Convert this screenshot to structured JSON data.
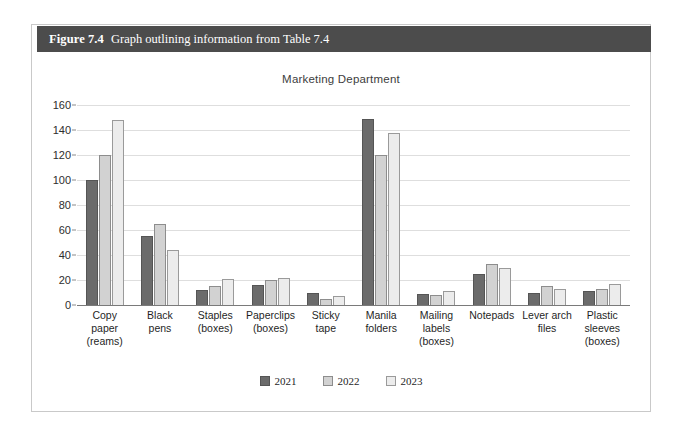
{
  "figure": {
    "number_label": "Figure 7.4",
    "caption": "Graph outlining information from Table 7.4"
  },
  "colors": {
    "header_bar": "#4c4c4c",
    "series_2021": "#6b6b6b",
    "series_2022": "#d2d2d2",
    "series_2023": "#ececec",
    "gridline": "#dedede",
    "axis": "#7a7a7a"
  },
  "chart_data": {
    "type": "bar",
    "title": "Marketing Department",
    "xlabel": "",
    "ylabel": "",
    "ylim": [
      0,
      160
    ],
    "ytick_step": 20,
    "yticks": [
      0,
      20,
      40,
      60,
      80,
      100,
      120,
      140,
      160
    ],
    "grid": true,
    "legend_position": "bottom",
    "categories": [
      "Copy paper (reams)",
      "Black pens",
      "Staples (boxes)",
      "Paperclips (boxes)",
      "Sticky tape",
      "Manila folders",
      "Mailing labels (boxes)",
      "Notepads",
      "Lever arch files",
      "Plastic sleeves (boxes)"
    ],
    "category_lines": [
      [
        "Copy",
        "paper",
        "(reams)"
      ],
      [
        "Black",
        "pens"
      ],
      [
        "Staples",
        "(boxes)"
      ],
      [
        "Paperclips",
        "(boxes)"
      ],
      [
        "Sticky",
        "tape"
      ],
      [
        "Manila",
        "folders"
      ],
      [
        "Mailing",
        "labels",
        "(boxes)"
      ],
      [
        "Notepads"
      ],
      [
        "Lever arch",
        "files"
      ],
      [
        "Plastic",
        "sleeves",
        "(boxes)"
      ]
    ],
    "series": [
      {
        "name": "2021",
        "values": [
          100,
          55,
          12,
          16,
          10,
          149,
          9,
          25,
          10,
          11
        ]
      },
      {
        "name": "2022",
        "values": [
          120,
          65,
          15,
          20,
          5,
          120,
          8,
          33,
          15,
          13
        ]
      },
      {
        "name": "2023",
        "values": [
          148,
          44,
          21,
          22,
          7,
          138,
          11,
          30,
          13,
          17
        ]
      }
    ]
  }
}
